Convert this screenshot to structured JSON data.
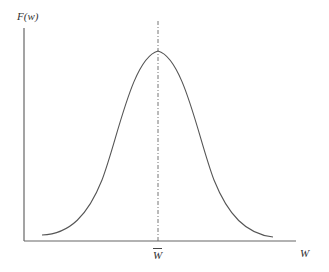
{
  "diagram": {
    "y_axis_label": "F(w)",
    "x_axis_label": "W",
    "mean_label": "W",
    "mean_has_overbar": true,
    "curve": "bell-shaped (normal) distribution symmetric about the mean",
    "colors": {
      "axis": "#555555",
      "curve": "#555555",
      "background": "#ffffff"
    }
  }
}
